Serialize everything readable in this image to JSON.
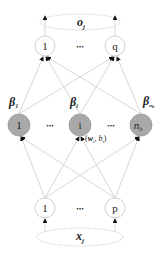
{
  "diagram": {
    "colors": {
      "edge": "#c8c8c8",
      "hidden_fill": "#a8a8a8",
      "hidden_stroke": "#9a9a9a",
      "io_stroke": "#c0c0c0",
      "ellipse_stroke": "#b8b8b8",
      "arrow": "#111111",
      "text": "#222222"
    },
    "output_group": {
      "label": "o",
      "sub": "j"
    },
    "input_group": {
      "label": "x",
      "sub": "j"
    },
    "output_nodes": [
      {
        "label": "1"
      },
      {
        "label": "q"
      }
    ],
    "hidden_nodes": [
      {
        "label": "1",
        "beta": "β",
        "beta_sub": "1"
      },
      {
        "label": "i",
        "beta": "β",
        "beta_sub": "i"
      },
      {
        "label": "n",
        "label_sub": "h",
        "beta": "β",
        "beta_sub": "n",
        "beta_subsub": "h"
      }
    ],
    "input_nodes": [
      {
        "label": "1"
      },
      {
        "label": "p"
      }
    ],
    "ellipsis": "•••",
    "weight_label": {
      "open": "(",
      "w": "w",
      "w_sub": "i",
      "comma": ", ",
      "b": "b",
      "b_sub": "i",
      "close": ")"
    }
  }
}
